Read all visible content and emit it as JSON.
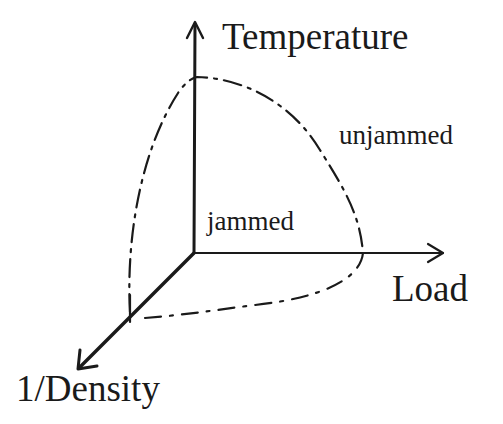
{
  "diagram": {
    "type": "3d-phase-diagram",
    "axes": {
      "vertical": {
        "label": "Temperature"
      },
      "horizontal": {
        "label": "Load"
      },
      "depth": {
        "label": "1/Density"
      }
    },
    "regions": {
      "inside": {
        "label": "jammed"
      },
      "outside": {
        "label": "unjammed"
      }
    },
    "boundary": {
      "style": "dashed",
      "description": "jamming surface enclosing origin"
    },
    "colors": {
      "ink": "#1a1a1a",
      "background": "#ffffff"
    }
  }
}
